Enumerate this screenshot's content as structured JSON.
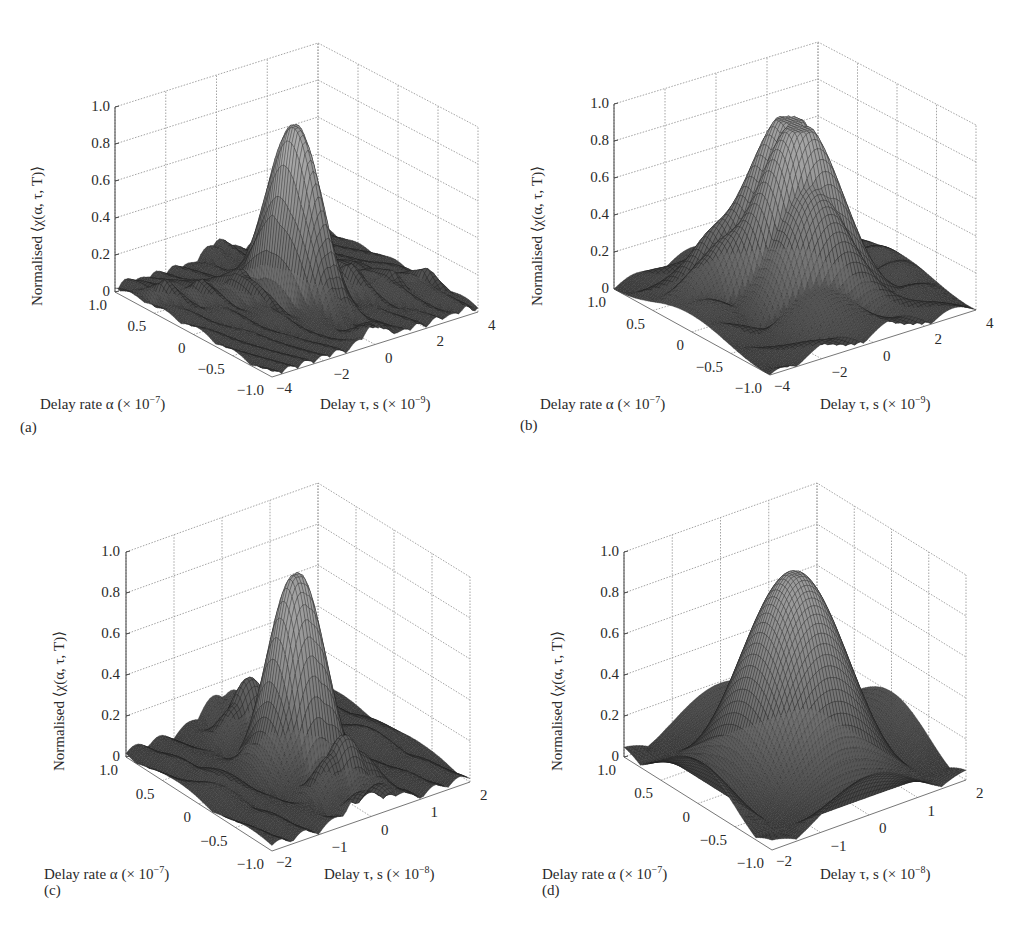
{
  "figure": {
    "panels": [
      {
        "id": "a",
        "label": "(a)",
        "zlabel": "Normalised ⟨χ(α, τ, T)⟩",
        "xlabel_text": "Delay rate α (× 10",
        "xlabel_exp": "−7",
        "xlabel_close": ")",
        "ylabel_text": "Delay τ, s (× 10",
        "ylabel_exp": "−9",
        "ylabel_close": ")"
      },
      {
        "id": "b",
        "label": "(b)",
        "zlabel": "Normalised ⟨χ(α, τ, T)⟩",
        "xlabel_text": "Delay rate α (× 10",
        "xlabel_exp": "−7",
        "xlabel_close": ")",
        "ylabel_text": "Delay τ, s (× 10",
        "ylabel_exp": "−9",
        "ylabel_close": ")"
      },
      {
        "id": "c",
        "label": "(c)",
        "zlabel": "Normalised ⟨χ(α, τ, T)⟩",
        "xlabel_text": "Delay rate α (× 10",
        "xlabel_exp": "−7",
        "xlabel_close": ")",
        "ylabel_text": "Delay τ, s (× 10",
        "ylabel_exp": "−8",
        "ylabel_close": ")"
      },
      {
        "id": "d",
        "label": "(d)",
        "zlabel": "Normalised ⟨χ(α, τ, T)⟩",
        "xlabel_text": "Delay rate α (× 10",
        "xlabel_exp": "−7",
        "xlabel_close": ")",
        "ylabel_text": "Delay τ, s (× 10",
        "ylabel_exp": "−8",
        "ylabel_close": ")"
      }
    ]
  },
  "colors": {
    "grid": "#9a9a9a",
    "axis": "#444444",
    "mesh_line": "#1e1e1e",
    "surface_low": "#3a3a3a",
    "surface_high": "#b8b8b8"
  },
  "chart_data": [
    {
      "type": "surface3d",
      "panel": "a",
      "title": "",
      "xlabel": "Delay rate α (× 10^−7)",
      "ylabel": "Delay τ, s (× 10^−9)",
      "zlabel": "Normalised ⟨χ(α, τ, T)⟩",
      "alpha_ticks": [
        "1.0",
        "0.5",
        "0",
        "−0.5",
        "−1.0"
      ],
      "alpha_range": [
        -1.0,
        1.0
      ],
      "tau_ticks": [
        "−4",
        "−2",
        "0",
        "2",
        "4"
      ],
      "tau_range": [
        -4,
        4
      ],
      "z_ticks": [
        "0",
        "0.2",
        "0.4",
        "0.6",
        "0.8",
        "1.0"
      ],
      "zlim": [
        0,
        1.0
      ],
      "peak": {
        "alpha": 0,
        "tau": 0,
        "z": 0.95
      },
      "description": "Narrow main lobe with low-level sidelobe ridge (~0.1-0.2) along tau axis",
      "shape": {
        "kind": "sinc_narrow",
        "tau_width": 0.55,
        "alpha_width": 0.35,
        "sidelobe": 0.14
      }
    },
    {
      "type": "surface3d",
      "panel": "b",
      "xlabel": "Delay rate α (× 10^−7)",
      "ylabel": "Delay τ, s (× 10^−9)",
      "zlabel": "Normalised ⟨χ(α, τ, T)⟩",
      "alpha_ticks": [
        "1.0",
        "0.5",
        "0",
        "−0.5",
        "−1.0"
      ],
      "alpha_range": [
        -1.0,
        1.0
      ],
      "tau_ticks": [
        "−4",
        "−2",
        "0",
        "2",
        "4"
      ],
      "tau_range": [
        -4,
        4
      ],
      "z_ticks": [
        "0",
        "0.2",
        "0.4",
        "0.6",
        "0.8",
        "1.0"
      ],
      "zlim": [
        0,
        1.0
      ],
      "peak": {
        "alpha": 0,
        "tau": 0,
        "z": 0.95
      },
      "description": "Broader main lobe, sidelobes ~0.2 with ripple along alpha",
      "shape": {
        "kind": "sinc_wide",
        "tau_width": 1.3,
        "alpha_width": 0.45,
        "sidelobe": 0.2
      }
    },
    {
      "type": "surface3d",
      "panel": "c",
      "xlabel": "Delay rate α (× 10^−7)",
      "ylabel": "Delay τ, s (× 10^−8)",
      "zlabel": "Normalised ⟨χ(α, τ, T)⟩",
      "alpha_ticks": [
        "1.0",
        "0.5",
        "0",
        "−0.5",
        "−1.0"
      ],
      "alpha_range": [
        -1.0,
        1.0
      ],
      "tau_ticks": [
        "−2",
        "−1",
        "0",
        "1",
        "2"
      ],
      "tau_range": [
        -2,
        2
      ],
      "z_ticks": [
        "0",
        "0.2",
        "0.4",
        "0.6",
        "0.8",
        "1.0"
      ],
      "zlim": [
        0,
        1.0
      ],
      "peak": {
        "alpha": 0,
        "tau": 0,
        "z": 0.95
      },
      "description": "Main lobe plus two sidelobes ~0.25 along alpha direction",
      "shape": {
        "kind": "sinc_alpha",
        "tau_width": 0.55,
        "alpha_width": 0.3,
        "sidelobe": 0.28
      }
    },
    {
      "type": "surface3d",
      "panel": "d",
      "xlabel": "Delay rate α (× 10^−7)",
      "ylabel": "Delay τ, s (× 10^−8)",
      "zlabel": "Normalised ⟨χ(α, τ, T)⟩",
      "alpha_ticks": [
        "1.0",
        "0.5",
        "0",
        "−0.5",
        "−1.0"
      ],
      "alpha_range": [
        -1.0,
        1.0
      ],
      "tau_ticks": [
        "−2",
        "−1",
        "0",
        "1",
        "2"
      ],
      "tau_range": [
        -2,
        2
      ],
      "z_ticks": [
        "0",
        "0.2",
        "0.4",
        "0.6",
        "0.8",
        "1.0"
      ],
      "zlim": [
        0,
        1.0
      ],
      "peak": {
        "alpha": 0,
        "tau": 0,
        "z": 0.95
      },
      "description": "Broad main lobe with four sidelobes ~0.3 along both axes (2D sinc)",
      "shape": {
        "kind": "sinc2d",
        "tau_width": 0.75,
        "alpha_width": 0.5,
        "sidelobe": 0.3
      }
    }
  ],
  "geometry": [
    {
      "panel": "a",
      "left": [
        115,
        292
      ],
      "front": [
        272,
        377
      ],
      "right": [
        478,
        312
      ],
      "back": [
        318,
        228
      ],
      "zpx": 185,
      "zlabel_pos": [
        30,
        300
      ],
      "zticks_x": 110,
      "label_pos": [
        20,
        420
      ],
      "xlabel_pos": [
        40,
        397
      ],
      "ylabel_pos": [
        320,
        397
      ]
    },
    {
      "panel": "b",
      "left": [
        614,
        289
      ],
      "front": [
        770,
        375
      ],
      "right": [
        976,
        310
      ],
      "back": [
        818,
        227
      ],
      "zpx": 185,
      "zlabel_pos": [
        530,
        300
      ],
      "zticks_x": 609,
      "label_pos": [
        520,
        418
      ],
      "xlabel_pos": [
        540,
        397
      ],
      "ylabel_pos": [
        820,
        397
      ]
    },
    {
      "panel": "c",
      "left": [
        126,
        757
      ],
      "front": [
        272,
        851
      ],
      "right": [
        470,
        782
      ],
      "back": [
        318,
        688
      ],
      "zpx": 205,
      "zlabel_pos": [
        52,
        765
      ],
      "zticks_x": 120,
      "label_pos": [
        44,
        883
      ],
      "xlabel_pos": [
        44,
        867
      ],
      "ylabel_pos": [
        324,
        867
      ]
    },
    {
      "panel": "d",
      "left": [
        624,
        757
      ],
      "front": [
        772,
        850
      ],
      "right": [
        966,
        780
      ],
      "back": [
        817,
        688
      ],
      "zpx": 205,
      "zlabel_pos": [
        550,
        765
      ],
      "zticks_x": 619,
      "label_pos": [
        542,
        883
      ],
      "xlabel_pos": [
        542,
        867
      ],
      "ylabel_pos": [
        820,
        867
      ]
    }
  ]
}
